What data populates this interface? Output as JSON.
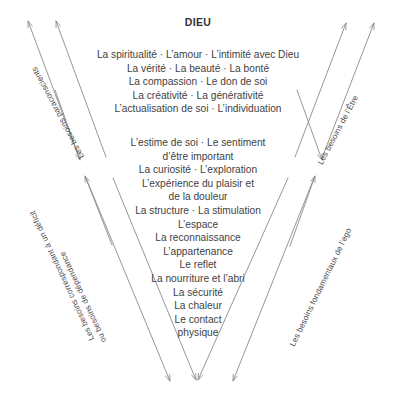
{
  "diagram": {
    "title": "DIEU",
    "stroke_color": "#8a8a8e",
    "text_color": "#3f3f42",
    "title_color": "#333336",
    "background_color": "#ffffff",
    "separator": "·"
  },
  "tiers": [
    {
      "id": "being-needs",
      "lines": [
        "La spiritualité · L’amour · L’intimité avec Dieu",
        "La vérité · La beauté · La bonté",
        "La compassion · Le don de soi",
        "La créativité · La générativité",
        "L’actualisation de soi · L’individuation"
      ]
    },
    {
      "id": "ego-needs",
      "lines": [
        "L’estime de soi · Le sentiment",
        "d’être important",
        "La curiosité · L’exploration",
        "L’expérience du plaisir et",
        "de la douleur",
        "La structure · La stimulation",
        "L’espace",
        "La reconnaissance",
        "L’appartenance",
        "Le reflet",
        "La nourriture et l’abri",
        "La sécurité",
        "La chaleur",
        "Le contact",
        "physique"
      ]
    }
  ],
  "axis_labels": {
    "upper_left": "Les besoins paraconscients",
    "lower_left_line1": "Les besoins correspondant à un déficit",
    "lower_left_line2": "ou besoins de dépendance",
    "upper_right": "Les besoins de l’Être",
    "lower_right": "Les besoins fondamentaux de l’ego"
  }
}
